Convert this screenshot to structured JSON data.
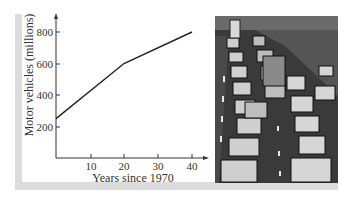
{
  "chart_data": {
    "type": "line",
    "title": "",
    "xlabel": "Years since 1970",
    "ylabel": "Motor vehicles (millions)",
    "x_ticks": [
      "10",
      "20",
      "30",
      "40"
    ],
    "y_ticks": [
      "200",
      "400",
      "600",
      "800"
    ],
    "xlim": [
      0,
      42
    ],
    "ylim": [
      0,
      880
    ],
    "grid": false,
    "legend": null,
    "series": [
      {
        "name": "Motor vehicles",
        "x": [
          0,
          20,
          40
        ],
        "y": [
          250,
          600,
          800
        ]
      }
    ]
  },
  "photo": {
    "description": "Black and white photo of congested multi-lane highway traffic"
  },
  "colors": {
    "line": "#222222",
    "axis": "#333333",
    "frame": "#dcdcdc"
  }
}
